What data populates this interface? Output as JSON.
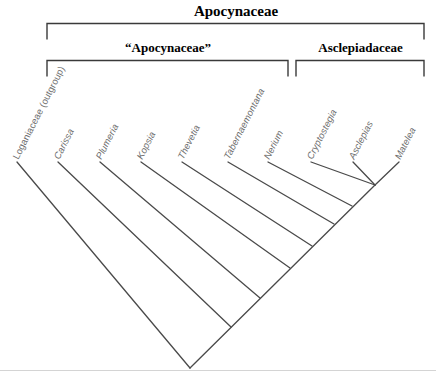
{
  "figure": {
    "background_color": "#ffffff",
    "branch_color": "#4a4a4a",
    "bracket_color": "#3a3a3a",
    "label_color": "#6d6d6d",
    "heading_color": "#000000",
    "frame_color": "#d4d4d4"
  },
  "brackets": [
    {
      "name": "apocynaceae-top",
      "label": "Apocynaceae",
      "x_start": 47,
      "x_end": 424,
      "y": 23,
      "tick_height": 16
    },
    {
      "name": "apocynaceae-quoted",
      "label": "“Apocynaceae”",
      "x_start": 47,
      "x_end": 288,
      "y": 60,
      "tick_height": 16
    },
    {
      "name": "asclepiadaceae",
      "label": "Asclepiadaceae",
      "x_start": 296,
      "x_end": 424,
      "y": 60,
      "tick_height": 16
    }
  ],
  "taxa": [
    {
      "label": "Loganiaceae (outgroup)",
      "tip_x": 17,
      "tip_y": 162,
      "label_x": 20,
      "label_y": 160,
      "italic": false,
      "group": "outgroup"
    },
    {
      "label": "Carissa",
      "tip_x": 58,
      "tip_y": 162,
      "label_x": 61,
      "label_y": 160,
      "italic": true,
      "group": "apocynaceae"
    },
    {
      "label": "Plumeria",
      "tip_x": 100,
      "tip_y": 162,
      "label_x": 103,
      "label_y": 160,
      "italic": true,
      "group": "apocynaceae"
    },
    {
      "label": "Kopsia",
      "tip_x": 141,
      "tip_y": 162,
      "label_x": 144,
      "label_y": 160,
      "italic": true,
      "group": "apocynaceae"
    },
    {
      "label": "Thevetia",
      "tip_x": 182,
      "tip_y": 162,
      "label_x": 185,
      "label_y": 160,
      "italic": true,
      "group": "apocynaceae"
    },
    {
      "label": "Tabernaemontana",
      "tip_x": 228,
      "tip_y": 162,
      "label_x": 231,
      "label_y": 160,
      "italic": true,
      "group": "apocynaceae"
    },
    {
      "label": "Nerium",
      "tip_x": 268,
      "tip_y": 162,
      "label_x": 271,
      "label_y": 160,
      "italic": true,
      "group": "apocynaceae"
    },
    {
      "label": "Cryptostegia",
      "tip_x": 311,
      "tip_y": 162,
      "label_x": 314,
      "label_y": 160,
      "italic": true,
      "group": "asclepiadaceae"
    },
    {
      "label": "Asclepias",
      "tip_x": 353,
      "tip_y": 162,
      "label_x": 356,
      "label_y": 160,
      "italic": true,
      "group": "asclepiadaceae"
    },
    {
      "label": "Matelea",
      "tip_x": 399,
      "tip_y": 162,
      "label_x": 402,
      "label_y": 160,
      "italic": true,
      "group": "asclepiadaceae"
    }
  ],
  "tree": {
    "type": "ladderized-cladogram",
    "root": {
      "x": 190,
      "y": 368
    },
    "branch_angle_degrees": 45,
    "backbone_nodes": [
      {
        "name": "node-root",
        "x": 190,
        "y": 368,
        "joins": "Loganiaceae (outgroup)"
      },
      {
        "name": "node-carissa",
        "x": 231,
        "y": 327,
        "joins": "Carissa"
      },
      {
        "name": "node-plumeria",
        "x": 260,
        "y": 298,
        "joins": "Plumeria"
      },
      {
        "name": "node-kopsia",
        "x": 290,
        "y": 268,
        "joins": "Kopsia"
      },
      {
        "name": "node-thevetia",
        "x": 312,
        "y": 246,
        "joins": "Thevetia"
      },
      {
        "name": "node-tabernaemontana",
        "x": 334,
        "y": 224,
        "joins": "Tabernaemontana"
      },
      {
        "name": "node-nerium",
        "x": 352,
        "y": 206,
        "joins": "Nerium"
      },
      {
        "name": "node-cryptostegia",
        "x": 375,
        "y": 185,
        "joins": "Cryptostegia"
      },
      {
        "name": "node-asclepias-matelea",
        "x": 375,
        "y": 185,
        "joins": "Asclepias + Matelea"
      }
    ],
    "sister_pair": {
      "left": "Asclepias",
      "right": "Matelea",
      "node_x": 375,
      "node_y": 185
    }
  }
}
